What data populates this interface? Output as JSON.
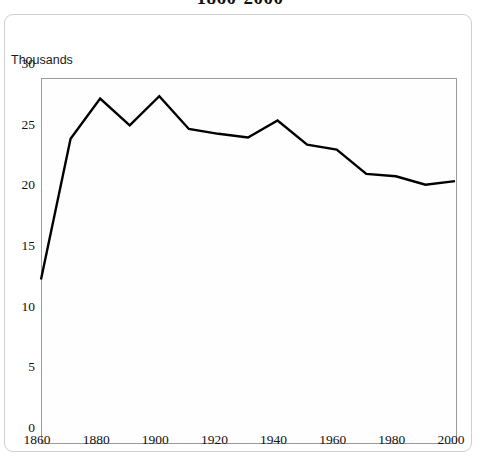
{
  "chart_title": "1860-2000",
  "y_axis_unit": "Thousands",
  "chart_data": {
    "type": "line",
    "title": "1860-2000",
    "subtitle": "",
    "xlabel": "",
    "ylabel": "Thousands",
    "ylim": [
      0,
      30
    ],
    "xlim": [
      1860,
      2000
    ],
    "grid": false,
    "legend": "none",
    "y_ticks": [
      0,
      5,
      10,
      15,
      20,
      25,
      30
    ],
    "y_tick_labels": [
      "0",
      "5",
      "10",
      "15",
      "20",
      "25",
      "30"
    ],
    "x_ticks": [
      1860,
      1880,
      1900,
      1920,
      1940,
      1960,
      1980,
      2000
    ],
    "x_tick_labels": [
      "1860",
      "1880",
      "1900",
      "1920",
      "1940",
      "1960",
      "1980",
      "2000"
    ],
    "x": [
      1860,
      1870,
      1880,
      1890,
      1900,
      1910,
      1920,
      1930,
      1940,
      1950,
      1960,
      1970,
      1980,
      1990,
      2000
    ],
    "values": [
      13.4,
      25.0,
      28.3,
      26.1,
      28.5,
      25.8,
      25.4,
      25.1,
      26.5,
      24.5,
      24.1,
      22.1,
      21.9,
      21.2,
      21.5
    ],
    "series": [
      {
        "name": "Thousands",
        "color": "#000000",
        "values": [
          13.4,
          25.0,
          28.3,
          26.1,
          28.5,
          25.8,
          25.4,
          25.1,
          26.5,
          24.5,
          24.1,
          22.1,
          21.9,
          21.2,
          21.5
        ]
      }
    ]
  },
  "colors": {
    "line": "#000000",
    "frame": "#9a9a9a",
    "panel_border": "#cfcfcf",
    "text": "#111111",
    "background": "#ffffff"
  }
}
